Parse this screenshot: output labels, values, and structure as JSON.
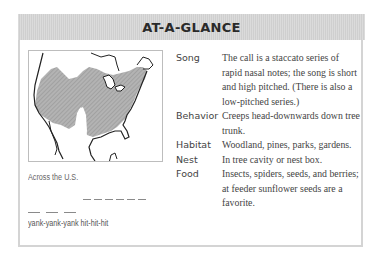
{
  "header": {
    "title": "AT-A-GLANCE"
  },
  "map": {
    "icon": "range-map-north-america",
    "caption": "Across the U.S."
  },
  "song_graph": {
    "pattern": "yank-yank-yank hit-hit-hit",
    "segments_high": 6,
    "segments_low": 3
  },
  "facts": [
    {
      "label": "Song",
      "value": "The call is a staccato series of rapid nasal notes; the song is short and high pitched. (There is also a low-pitched series.)"
    },
    {
      "label": "Behavior",
      "value": "Creeps head-downwards down tree trunk."
    },
    {
      "label": "Habitat",
      "value": "Woodland, pines, parks, gardens."
    },
    {
      "label": "Nest",
      "value": "In tree cavity or nest box."
    },
    {
      "label": "Food",
      "value": "Insects, spiders, seeds, and berries; at feeder sunflower seeds are a favorite."
    }
  ],
  "colors": {
    "header_bg": "#cfcfcf",
    "border": "#d4d4d4",
    "range_fill": "#a8a8a8"
  }
}
